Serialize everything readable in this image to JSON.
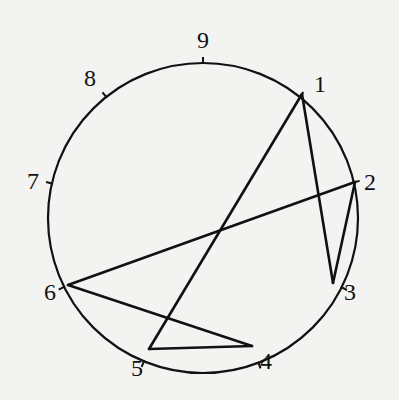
{
  "diagram": {
    "type": "circle-chord-diagram",
    "circle": {
      "cx": 203,
      "cy": 218,
      "r": 155,
      "stroke": "#111111"
    },
    "points": [
      {
        "id": "1",
        "x": 302,
        "y": 94,
        "label": "1",
        "lx": 320,
        "ly": 84
      },
      {
        "id": "2",
        "x": 355,
        "y": 182,
        "label": "2",
        "lx": 370,
        "ly": 182
      },
      {
        "id": "3",
        "x": 333,
        "y": 283,
        "label": "3",
        "lx": 350,
        "ly": 292
      },
      {
        "id": "4",
        "x": 252,
        "y": 346,
        "label": "4",
        "lx": 266,
        "ly": 361
      },
      {
        "id": "5",
        "x": 149,
        "y": 349,
        "label": "5",
        "lx": 137,
        "ly": 368
      },
      {
        "id": "6",
        "x": 68,
        "y": 285,
        "label": "6",
        "lx": 50,
        "ly": 292
      },
      {
        "id": "7",
        "x": 50,
        "y": 183,
        "label": "7",
        "lx": 33,
        "ly": 181
      },
      {
        "id": "8",
        "x": 103,
        "y": 93,
        "label": "8",
        "lx": 90,
        "ly": 78
      },
      {
        "id": "9",
        "x": 203,
        "y": 60,
        "label": "9",
        "lx": 203,
        "ly": 40
      }
    ],
    "chords": [
      {
        "from": "1",
        "to": "3"
      },
      {
        "from": "1",
        "to": "5"
      },
      {
        "from": "2",
        "to": "3"
      },
      {
        "from": "2",
        "to": "6"
      },
      {
        "from": "6",
        "to": "4"
      },
      {
        "from": "5",
        "to": "4"
      }
    ],
    "ticks": [
      "1",
      "2",
      "3",
      "4",
      "5",
      "6",
      "7",
      "8",
      "9"
    ]
  }
}
